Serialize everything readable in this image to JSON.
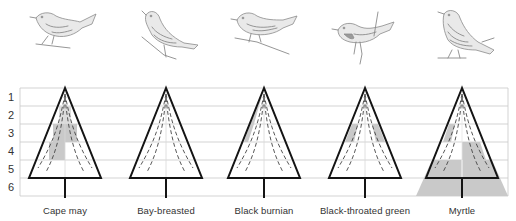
{
  "figure": {
    "type": "diagram",
    "row_labels": [
      "1",
      "2",
      "3",
      "4",
      "5",
      "6"
    ],
    "colors": {
      "grid": "#c8c8c8",
      "tree_outline": "#141414",
      "shading": "#c9c9c9",
      "dashed_contours": "#444444",
      "bird_sketch": "#8a8a8a"
    },
    "species": [
      {
        "name": "Cape may",
        "bird_icon": "warbler-perched-left-icon",
        "shaded_zones": [
          {
            "zone": 2,
            "side": "both",
            "extent": "inner-trace"
          },
          {
            "zone": 3,
            "side": "both",
            "extent": "full"
          },
          {
            "zone": 4,
            "side": "left",
            "extent": "full"
          }
        ]
      },
      {
        "name": "Bay-breasted",
        "bird_icon": "warbler-upright-icon",
        "shaded_zones": []
      },
      {
        "name": "Black burnian",
        "bird_icon": "warbler-perched-left-icon",
        "shaded_zones": [
          {
            "zone": 2,
            "side": "left",
            "extent": "outer-strip"
          },
          {
            "zone": 3,
            "side": "left",
            "extent": "outer-strip"
          }
        ]
      },
      {
        "name": "Black-throated green",
        "bird_icon": "warbler-hanging-icon",
        "shaded_zones": [
          {
            "zone": 3,
            "side": "left",
            "extent": "outer-strip"
          },
          {
            "zone": 3,
            "side": "right",
            "extent": "outer-strip"
          }
        ]
      },
      {
        "name": "Myrtle",
        "bird_icon": "warbler-standing-icon",
        "shaded_zones": [
          {
            "zone": 3,
            "side": "left",
            "extent": "outer-strip"
          },
          {
            "zone": 4,
            "side": "right",
            "extent": "full"
          },
          {
            "zone": 5,
            "side": "both",
            "extent": "full"
          },
          {
            "zone": 6,
            "side": "both",
            "extent": "ground-below"
          }
        ]
      }
    ]
  }
}
